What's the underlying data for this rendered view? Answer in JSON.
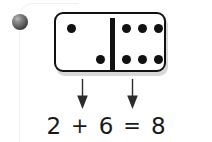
{
  "worksheet": {
    "title": "Domino addition fact",
    "marker_icon": "sphere-bullet-icon"
  },
  "domino": {
    "left_pips": 2,
    "right_pips": 6,
    "left_pip_positions": [
      {
        "x": 11,
        "y": 10
      },
      {
        "x": 40,
        "y": 41
      }
    ],
    "right_pip_positions": [
      {
        "x": 66,
        "y": 10
      },
      {
        "x": 82,
        "y": 10
      },
      {
        "x": 98,
        "y": 10
      },
      {
        "x": 66,
        "y": 41
      },
      {
        "x": 82,
        "y": 41
      },
      {
        "x": 98,
        "y": 41
      }
    ],
    "pip_color": "#111111",
    "body_color": "#ffffff",
    "outline_color": "#111111",
    "shadow_color": "#d8d8d8"
  },
  "arrows": [
    {
      "name": "arrow-to-first-addend",
      "direction": "down",
      "points_to": "2"
    },
    {
      "name": "arrow-to-second-addend",
      "direction": "down",
      "points_to": "6"
    }
  ],
  "equation": {
    "first_addend": "2",
    "plus_sign": "+",
    "second_addend": "6",
    "equals_sign": "=",
    "sum": "8",
    "text_color": "#1a1a1a"
  }
}
